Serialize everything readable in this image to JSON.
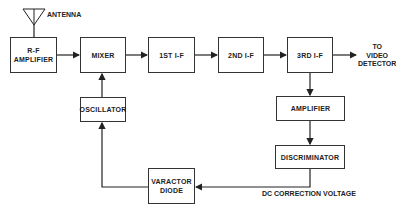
{
  "diagram": {
    "type": "block-diagram",
    "blocks": {
      "rf_amplifier": {
        "line1": "R-F",
        "line2": "AMPLIFIER"
      },
      "mixer": {
        "label": "MIXER"
      },
      "if1": {
        "label": "1ST I-F"
      },
      "if2": {
        "label": "2ND I-F"
      },
      "if3": {
        "label": "3RD I-F"
      },
      "oscillator": {
        "label": "OSCILLATOR"
      },
      "amplifier": {
        "label": "AMPLIFIER"
      },
      "discriminator": {
        "label": "DISCRIMINATOR"
      },
      "varactor_diode": {
        "line1": "VARACTOR",
        "line2": "DIODE"
      }
    },
    "labels": {
      "antenna": "ANTENNA",
      "output_line1": "TO",
      "output_line2": "VIDEO",
      "output_line3": "DETECTOR",
      "dc_correction": "DC CORRECTION VOLTAGE"
    },
    "connections": [
      {
        "from": "antenna",
        "to": "rf_amplifier"
      },
      {
        "from": "rf_amplifier",
        "to": "mixer"
      },
      {
        "from": "mixer",
        "to": "if1"
      },
      {
        "from": "if1",
        "to": "if2"
      },
      {
        "from": "if2",
        "to": "if3"
      },
      {
        "from": "if3",
        "to": "video_detector"
      },
      {
        "from": "if3",
        "to": "amplifier"
      },
      {
        "from": "amplifier",
        "to": "discriminator"
      },
      {
        "from": "discriminator",
        "to": "varactor_diode",
        "label": "DC CORRECTION VOLTAGE"
      },
      {
        "from": "varactor_diode",
        "to": "oscillator"
      },
      {
        "from": "oscillator",
        "to": "mixer"
      }
    ],
    "colors": {
      "line": "#222222",
      "background": "#ffffff"
    }
  }
}
